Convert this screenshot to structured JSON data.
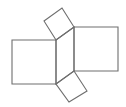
{
  "diagram": {
    "stroke_color": "#6e6e6e",
    "stroke_width": 1.1,
    "background": "#ffffff",
    "shapes": [
      {
        "name": "center-parallelogram",
        "points": "56,40 74,27 74,71 56,84"
      },
      {
        "name": "left-square",
        "points": "12,40 56,40 56,84 12,84"
      },
      {
        "name": "right-square",
        "points": "74,27 118,27 118,71 74,71"
      },
      {
        "name": "top-square",
        "points": "44,21 62,8 74,27 56,40"
      },
      {
        "name": "bottom-square",
        "points": "56,84 74,71 87,91 69,102"
      }
    ]
  }
}
